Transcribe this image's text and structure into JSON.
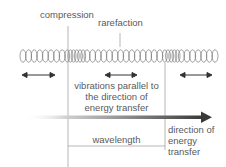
{
  "diagram": {
    "type": "longitudinal-wave-spring",
    "labels": {
      "compression": "compression",
      "rarefaction": "rarefaction",
      "vibrations_line1": "vibrations parallel to",
      "vibrations_line2": "the direction of",
      "vibrations_line3": "energy transfer",
      "wavelength": "wavelength",
      "direction_line1": "direction of",
      "direction_line2": "energy",
      "direction_line3": "transfer"
    },
    "colors": {
      "text": "#5a5a5a",
      "lines": "#888888",
      "coil": "#777777",
      "arrow_dark": "#444444",
      "arrow_light": "#ffffff"
    },
    "spring": {
      "x_start": 20,
      "x_end": 212,
      "compression_regions": [
        [
          64,
          82
        ],
        [
          158,
          176
        ]
      ]
    },
    "double_arrows": [
      {
        "x1": 22,
        "x2": 55
      },
      {
        "x1": 105,
        "x2": 137
      },
      {
        "x1": 180,
        "x2": 212
      }
    ]
  }
}
